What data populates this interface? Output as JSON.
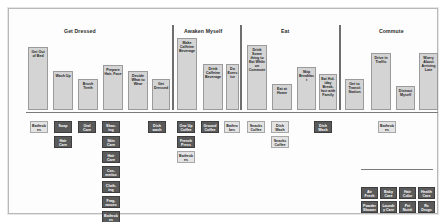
{
  "board": {
    "title": "Daily Morning Routine Story Map",
    "colors": {
      "canvas_background": "#fdfdfd",
      "page_background": "#ffffff",
      "canvas_border": "#b9b9b9",
      "activity_card": "#d4d4d4",
      "activity_card_border": "#9b9b9b",
      "story_card": "#5a5a5a",
      "story_card_border": "#3e3e3e",
      "pale_card": "#e3e3e3",
      "divider": "#6f6f6f",
      "text_dark": "#1d1d1d",
      "text_light": "#ffffff"
    }
  },
  "groups": [
    {
      "id": "get-dressed",
      "label": "Get Dressed",
      "x": 55,
      "y": 19
    },
    {
      "id": "awaken-myself",
      "label": "Awaken Myself",
      "x": 175,
      "y": 19
    },
    {
      "id": "eat",
      "label": "Eat",
      "x": 272,
      "y": 19
    },
    {
      "id": "commute",
      "label": "Commute",
      "x": 370,
      "y": 19
    }
  ],
  "dividers": {
    "vertical": [
      {
        "id": "divider-get-dressed-awaken",
        "x": 163,
        "y": 16,
        "height": 85
      },
      {
        "id": "divider-awaken-eat",
        "x": 231,
        "y": 16,
        "height": 85
      },
      {
        "id": "divider-eat-commute",
        "x": 330,
        "y": 16,
        "height": 85
      }
    ],
    "horizontal": [
      {
        "id": "divider-activity-band",
        "x": 17,
        "y": 103,
        "width": 412
      },
      {
        "id": "divider-lower-band",
        "x": 352,
        "y": 160,
        "width": 72
      }
    ]
  },
  "activity_cards": [
    {
      "id": "get-out-of-bed",
      "label": "Get Out of Bed",
      "x": 19,
      "y": 38,
      "w": 20,
      "h": 63,
      "tone": "light"
    },
    {
      "id": "wash-up",
      "label": "Wash Up",
      "x": 44,
      "y": 62,
      "w": 20,
      "h": 39,
      "tone": "light"
    },
    {
      "id": "brush-teeth",
      "label": "Brush Teeth",
      "x": 69,
      "y": 70,
      "w": 20,
      "h": 31,
      "tone": "light"
    },
    {
      "id": "prepare-hair-face",
      "label": "Prepare Hair, Face",
      "x": 94,
      "y": 56,
      "w": 20,
      "h": 45,
      "tone": "light"
    },
    {
      "id": "decide-what-to-wear",
      "label": "Decide What to Wear",
      "x": 119,
      "y": 62,
      "w": 20,
      "h": 39,
      "tone": "light"
    },
    {
      "id": "get-dressed-card",
      "label": "Get Dressed",
      "x": 143,
      "y": 70,
      "w": 18,
      "h": 31,
      "tone": "light"
    },
    {
      "id": "make-caffeine-beverage",
      "label": "Make Caffeine Beverage",
      "x": 168,
      "y": 29,
      "w": 20,
      "h": 72,
      "tone": "light"
    },
    {
      "id": "drink-caffeine-beverage",
      "label": "Drink Caffeine Beverage",
      "x": 194,
      "y": 55,
      "w": 20,
      "h": 46,
      "tone": "light"
    },
    {
      "id": "do-exercise",
      "label": "Do Exercise",
      "x": 217,
      "y": 55,
      "w": 13,
      "h": 46,
      "tone": "light"
    },
    {
      "id": "drink-some-thing-to-eat",
      "label": "Drink Some thing to Eat While on Commute",
      "x": 238,
      "y": 36,
      "w": 20,
      "h": 65,
      "tone": "light"
    },
    {
      "id": "eat-at-home",
      "label": "Eat at Home",
      "x": 263,
      "y": 75,
      "w": 20,
      "h": 26,
      "tone": "light"
    },
    {
      "id": "skip-breakfast",
      "label": "Skip Breakfast",
      "x": 288,
      "y": 58,
      "w": 19,
      "h": 43,
      "tone": "light"
    },
    {
      "id": "eat-holiday-breakfast-family",
      "label": "Eat Hol-iday Break-fast with Family",
      "x": 310,
      "y": 65,
      "w": 18,
      "h": 36,
      "tone": "light"
    },
    {
      "id": "get-to-transit-station",
      "label": "Get to Transit Station",
      "x": 336,
      "y": 70,
      "w": 19,
      "h": 31,
      "tone": "light"
    },
    {
      "id": "drive-in-traffic",
      "label": "Drive in Traffic",
      "x": 362,
      "y": 44,
      "w": 20,
      "h": 57,
      "tone": "light"
    },
    {
      "id": "distract-myself",
      "label": "Distract Myself",
      "x": 387,
      "y": 77,
      "w": 19,
      "h": 24,
      "tone": "light"
    },
    {
      "id": "worry-about-arriving-late",
      "label": "Worry About Arriving Late",
      "x": 410,
      "y": 44,
      "w": 19,
      "h": 57,
      "tone": "light"
    }
  ],
  "story_cards": [
    {
      "id": "bathrobe-1",
      "label": "Bathrobes",
      "x": 21,
      "y": 112,
      "w": 18,
      "h": 12,
      "tone": "pale"
    },
    {
      "id": "soap",
      "label": "Soap",
      "x": 45,
      "y": 112,
      "w": 18,
      "h": 12,
      "tone": "dark"
    },
    {
      "id": "oral-care",
      "label": "Oral Care",
      "x": 69,
      "y": 112,
      "w": 18,
      "h": 12,
      "tone": "dark"
    },
    {
      "id": "shaving",
      "label": "Shav-ing",
      "x": 93,
      "y": 112,
      "w": 18,
      "h": 12,
      "tone": "dark"
    },
    {
      "id": "hair-care-1",
      "label": "Hair Care",
      "x": 45,
      "y": 127,
      "w": 18,
      "h": 12,
      "tone": "dark"
    },
    {
      "id": "skin-care",
      "label": "Skin Care",
      "x": 93,
      "y": 127,
      "w": 18,
      "h": 12,
      "tone": "dark"
    },
    {
      "id": "hair-care-2",
      "label": "Hair Care",
      "x": 93,
      "y": 142,
      "w": 18,
      "h": 12,
      "tone": "dark"
    },
    {
      "id": "cosmetics",
      "label": "Cos-metics",
      "x": 93,
      "y": 157,
      "w": 18,
      "h": 12,
      "tone": "dark"
    },
    {
      "id": "clothing",
      "label": "Cloth-ing",
      "x": 93,
      "y": 172,
      "w": 18,
      "h": 12,
      "tone": "dark"
    },
    {
      "id": "fragrances",
      "label": "Frag-rances",
      "x": 93,
      "y": 187,
      "w": 18,
      "h": 12,
      "tone": "dark"
    },
    {
      "id": "bathrobe-2",
      "label": "Bathrobes",
      "x": 93,
      "y": 202,
      "w": 18,
      "h": 12,
      "tone": "dark"
    },
    {
      "id": "dish-wash-left",
      "label": "Dish wash",
      "x": 139,
      "y": 112,
      "w": 18,
      "h": 12,
      "tone": "dark"
    },
    {
      "id": "one-up-coffee",
      "label": "One Up Coffee",
      "x": 168,
      "y": 112,
      "w": 18,
      "h": 12,
      "tone": "dark"
    },
    {
      "id": "ground-coffee",
      "label": "Ground Coffee",
      "x": 192,
      "y": 112,
      "w": 18,
      "h": 12,
      "tone": "dark"
    },
    {
      "id": "bathrobe-3",
      "label": "Bathrobes",
      "x": 215,
      "y": 112,
      "w": 16,
      "h": 12,
      "tone": "pale"
    },
    {
      "id": "french-press",
      "label": "French Press",
      "x": 168,
      "y": 127,
      "w": 18,
      "h": 12,
      "tone": "dark"
    },
    {
      "id": "bathrobe-4",
      "label": "Bathrobes",
      "x": 168,
      "y": 142,
      "w": 18,
      "h": 12,
      "tone": "pale"
    },
    {
      "id": "snacks-coffee-1",
      "label": "Snacks Coffee",
      "x": 238,
      "y": 112,
      "w": 18,
      "h": 12,
      "tone": "pale"
    },
    {
      "id": "dish-wash-1",
      "label": "Dish Wash",
      "x": 262,
      "y": 112,
      "w": 18,
      "h": 12,
      "tone": "pale"
    },
    {
      "id": "snacks-coffee-2",
      "label": "Snacks Coffee",
      "x": 262,
      "y": 127,
      "w": 18,
      "h": 12,
      "tone": "pale"
    },
    {
      "id": "dish-wash-2",
      "label": "Dish Wash",
      "x": 305,
      "y": 112,
      "w": 18,
      "h": 12,
      "tone": "dark"
    },
    {
      "id": "bathrobe-5",
      "label": "Bathrobes",
      "x": 369,
      "y": 112,
      "w": 18,
      "h": 12,
      "tone": "pale"
    },
    {
      "id": "air-fresh",
      "label": "Air Fresh",
      "x": 352,
      "y": 178,
      "w": 17,
      "h": 12,
      "tone": "dark"
    },
    {
      "id": "baby-care",
      "label": "Baby Care",
      "x": 371,
      "y": 178,
      "w": 17,
      "h": 12,
      "tone": "dark"
    },
    {
      "id": "hair-color",
      "label": "Hair Color",
      "x": 390,
      "y": 178,
      "w": 17,
      "h": 12,
      "tone": "dark"
    },
    {
      "id": "health-care",
      "label": "Health Care",
      "x": 409,
      "y": 178,
      "w": 17,
      "h": 12,
      "tone": "dark"
    },
    {
      "id": "powder-shower",
      "label": "Powder Shower",
      "x": 352,
      "y": 192,
      "w": 17,
      "h": 12,
      "tone": "dark"
    },
    {
      "id": "laundry-care",
      "label": "Laundry Care",
      "x": 371,
      "y": 192,
      "w": 17,
      "h": 12,
      "tone": "dark"
    },
    {
      "id": "pet-nutrition",
      "label": "Pet Nutrit",
      "x": 390,
      "y": 192,
      "w": 17,
      "h": 12,
      "tone": "dark"
    },
    {
      "id": "rx-drugs",
      "label": "Rx Drugs",
      "x": 409,
      "y": 192,
      "w": 17,
      "h": 12,
      "tone": "dark"
    }
  ]
}
